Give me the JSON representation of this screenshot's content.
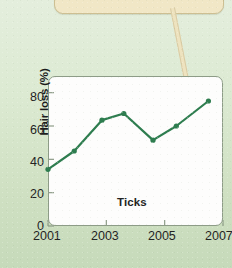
{
  "chart_data": {
    "type": "line",
    "title": "",
    "subtitle": "",
    "xlabel": "",
    "ylabel": "Hair loss (%)",
    "xlim": [
      2001,
      2007
    ],
    "ylim": [
      0,
      90
    ],
    "grid": false,
    "legend_position": "none",
    "annotations": [
      "Ticks"
    ],
    "x_tick_labels": [
      "2001",
      "2003",
      "2005",
      "2007"
    ],
    "x_tick_values": [
      2001,
      2003,
      2005,
      2007
    ],
    "y_tick_labels": [
      "0",
      "20",
      "40",
      "60",
      "80"
    ],
    "y_tick_values": [
      0,
      20,
      40,
      60,
      80
    ],
    "series": [
      {
        "name": "Ticks",
        "color": "#2e7d4f",
        "marker": "circle",
        "x": [
          2001.0,
          2001.9,
          2002.85,
          2003.6,
          2004.6,
          2005.4,
          2006.5
        ],
        "values": [
          34,
          45,
          63.5,
          67.5,
          51.5,
          60,
          75
        ]
      }
    ]
  },
  "chart": {
    "ylabel": "Hair loss (%)",
    "inplot_label": "Ticks",
    "y_ticks": [
      "80",
      "60",
      "40",
      "20",
      "0"
    ],
    "x_ticks": [
      "2001",
      "2003",
      "2005",
      "2007"
    ]
  },
  "colors": {
    "line": "#2e7d4f",
    "plot_background": "#fdfdfc",
    "plot_border": "#8d9c87",
    "page_background": "#dcead2",
    "callout_fill": "#f1e7c6",
    "callout_border": "#cdbf92",
    "text": "#232323"
  }
}
